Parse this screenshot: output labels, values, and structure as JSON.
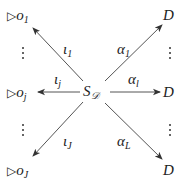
{
  "diagram": {
    "center": {
      "base": "S",
      "sub": "𝒟"
    },
    "left_nodes": [
      {
        "prefix": "▷",
        "base": "o",
        "sub": "1"
      },
      {
        "prefix": "▷",
        "base": "o",
        "sub": "j"
      },
      {
        "prefix": "▷",
        "base": "o",
        "sub": "J"
      }
    ],
    "right_nodes": [
      {
        "base": "D"
      },
      {
        "base": "D"
      },
      {
        "base": "D"
      }
    ],
    "left_arrows": [
      {
        "base": "ι",
        "sub": "1"
      },
      {
        "base": "ι",
        "sub": "j"
      },
      {
        "base": "ι",
        "sub": "J"
      }
    ],
    "right_arrows": [
      {
        "base": "α",
        "sub": "1"
      },
      {
        "base": "α",
        "sub": "l"
      },
      {
        "base": "α",
        "sub": "L"
      }
    ],
    "ellipsis": "⋮",
    "colors": {
      "arrow": "#444444",
      "text": "#222222"
    }
  }
}
